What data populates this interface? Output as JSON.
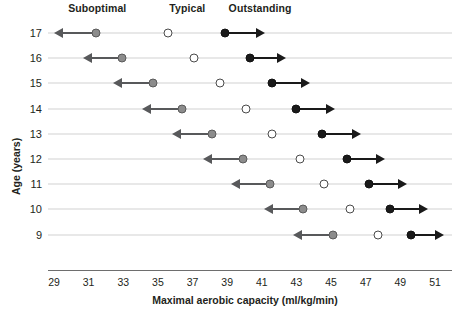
{
  "chart_data": {
    "type": "scatter",
    "title": "",
    "xlabel": "Maximal aerobic capacity (ml/kg/min)",
    "ylabel": "Age (years)",
    "xlim": [
      29,
      51
    ],
    "ylim_categories": [
      "17",
      "16",
      "15",
      "14",
      "13",
      "12",
      "11",
      "10",
      "9"
    ],
    "xticks": [
      "29",
      "31",
      "33",
      "35",
      "37",
      "39",
      "41",
      "43",
      "45",
      "47",
      "49",
      "51"
    ],
    "xtick_values": [
      29,
      31,
      33,
      35,
      37,
      39,
      41,
      43,
      45,
      47,
      49,
      51
    ],
    "grid": true,
    "legend_position": "top",
    "legend": [
      {
        "label": "Suboptimal",
        "marker": "filled-gray-circle",
        "color": "#8c8c8c",
        "x_anchor": 31.5
      },
      {
        "label": "Typical",
        "marker": "open-circle",
        "color": "#ffffff",
        "x_anchor": 36.7
      },
      {
        "label": "Outstanding",
        "marker": "filled-black-circle",
        "color": "#1a1a1a",
        "x_anchor": 40.9
      }
    ],
    "series": [
      {
        "name": "Suboptimal",
        "marker": "filled-gray-circle",
        "arrow": "left",
        "values": [
          31.4,
          32.9,
          34.7,
          36.4,
          38.1,
          39.9,
          41.5,
          43.4,
          45.1
        ],
        "arrow_tips": [
          29.0,
          30.7,
          32.4,
          34.1,
          35.8,
          37.6,
          39.2,
          41.1,
          42.8
        ]
      },
      {
        "name": "Typical",
        "marker": "open-circle",
        "arrow": "none",
        "values": [
          35.6,
          37.1,
          38.6,
          40.1,
          41.6,
          43.2,
          44.6,
          46.1,
          47.7
        ]
      },
      {
        "name": "Outstanding",
        "marker": "filled-black-circle",
        "arrow": "right",
        "values": [
          38.9,
          40.3,
          41.6,
          43.0,
          44.5,
          45.9,
          47.2,
          48.4,
          49.6
        ],
        "arrow_tips": [
          41.2,
          42.4,
          43.8,
          45.2,
          46.7,
          48.1,
          49.4,
          50.6,
          51.5
        ]
      }
    ],
    "categories": [
      "17",
      "16",
      "15",
      "14",
      "13",
      "12",
      "11",
      "10",
      "9"
    ]
  }
}
